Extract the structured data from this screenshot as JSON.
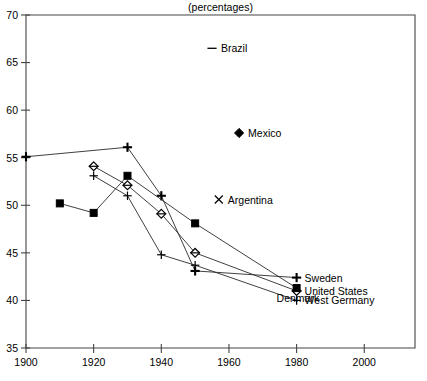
{
  "subtitle": "(percentages)",
  "axes": {
    "x": {
      "label": "",
      "min": 1900,
      "max": 2015,
      "ticks": [
        1900,
        1920,
        1940,
        1960,
        1980,
        2000
      ],
      "ticklabels": [
        "1900",
        "1920",
        "1940",
        "1960",
        "1980",
        "2000"
      ]
    },
    "y": {
      "label": "",
      "min": 35,
      "max": 70,
      "ticks": [
        35,
        40,
        45,
        50,
        55,
        60,
        65,
        70
      ],
      "ticklabels": [
        "35",
        "40",
        "45",
        "50",
        "55",
        "60",
        "65",
        "70"
      ]
    }
  },
  "annotations": [
    {
      "name": "brazil",
      "marker": "dash",
      "label": "Brazil",
      "x": 1955,
      "y": 66.5
    },
    {
      "name": "mexico",
      "marker": "filled-diamond",
      "label": "Mexico",
      "x": 1963,
      "y": 57.6
    },
    {
      "name": "argentina",
      "marker": "x",
      "label": "Argentina",
      "x": 1957,
      "y": 50.6
    }
  ],
  "series_labels": [
    {
      "name": "sweden",
      "label": "Sweden",
      "marker": "bold-plus"
    },
    {
      "name": "united-states",
      "label": "United States",
      "marker": "diamond"
    },
    {
      "name": "west-germany",
      "label": "West Germany",
      "marker": "thin-plus"
    },
    {
      "name": "denmark",
      "label": "Denmark",
      "marker": "filled-square"
    }
  ],
  "chart_data": {
    "type": "line",
    "title": "",
    "subtitle": "(percentages)",
    "xlabel": "",
    "ylabel": "",
    "xlim": [
      1900,
      2015
    ],
    "ylim": [
      35,
      70
    ],
    "grid": false,
    "legend_position": "inline-right-endpoint",
    "series": [
      {
        "name": "Sweden",
        "marker": "bold-plus",
        "x": [
          1900,
          1930,
          1940,
          1950,
          1980
        ],
        "y": [
          55.1,
          56.1,
          51.0,
          43.1,
          42.4
        ]
      },
      {
        "name": "United States",
        "marker": "diamond",
        "x": [
          1920,
          1930,
          1940,
          1950,
          1980
        ],
        "y": [
          54.1,
          52.1,
          49.1,
          45.0,
          41.0
        ]
      },
      {
        "name": "West Germany",
        "marker": "thin-plus",
        "x": [
          1920,
          1930,
          1940,
          1950,
          1980
        ],
        "y": [
          53.1,
          51.0,
          44.8,
          43.7,
          40.0
        ]
      },
      {
        "name": "Denmark",
        "marker": "filled-square",
        "x": [
          1910,
          1920,
          1930,
          1950,
          1980
        ],
        "y": [
          50.2,
          49.2,
          53.1,
          48.1,
          41.3
        ]
      }
    ],
    "annotations": [
      {
        "label": "Brazil",
        "marker": "dash",
        "x": 1955,
        "y": 66.5
      },
      {
        "label": "Mexico",
        "marker": "filled-diamond",
        "x": 1963,
        "y": 57.6
      },
      {
        "label": "Argentina",
        "marker": "x",
        "x": 1957,
        "y": 50.6
      }
    ]
  }
}
